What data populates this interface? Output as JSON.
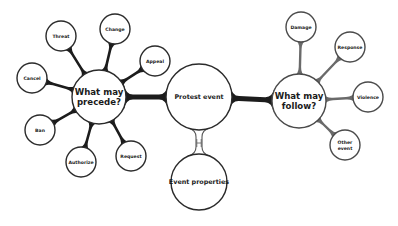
{
  "diagram": {
    "colors": {
      "background": "#ffffff",
      "stroke_dark": "#2a2a2a",
      "stroke_right": "#4a4a4a",
      "connector_left": "#1c1c1c",
      "connector_right": "#6a6a6a",
      "connector_main": "#1c1c1c",
      "connector_properties": "#555555"
    },
    "center": {
      "id": "protest",
      "label": "Protest event",
      "cx": 199,
      "cy": 97,
      "r": 33
    },
    "properties": {
      "id": "properties",
      "label": "Event properties",
      "cx": 199,
      "cy": 182,
      "r": 28
    },
    "precede_hub": {
      "id": "precede",
      "label_line1": "What may",
      "label_line2": "precede?",
      "cx": 99,
      "cy": 97,
      "r": 27
    },
    "follow_hub": {
      "id": "follow",
      "label_line1": "What may",
      "label_line2": "follow?",
      "cx": 299,
      "cy": 101,
      "r": 27
    },
    "precede_nodes": [
      {
        "label": "Cancel",
        "cx": 32,
        "cy": 78,
        "r": 15
      },
      {
        "label": "Threat",
        "cx": 61,
        "cy": 36,
        "r": 15
      },
      {
        "label": "Change",
        "cx": 115,
        "cy": 29,
        "r": 15
      },
      {
        "label": "Appeal",
        "cx": 155,
        "cy": 61,
        "r": 15
      },
      {
        "label": "Ban",
        "cx": 40,
        "cy": 130,
        "r": 15
      },
      {
        "label": "Authorize",
        "cx": 81,
        "cy": 162,
        "r": 15
      },
      {
        "label": "Request",
        "cx": 131,
        "cy": 156,
        "r": 15
      }
    ],
    "follow_nodes": [
      {
        "label": "Damage",
        "cx": 301,
        "cy": 27,
        "r": 15
      },
      {
        "label": "Response",
        "cx": 350,
        "cy": 47,
        "r": 15
      },
      {
        "label": "Violence",
        "cx": 368,
        "cy": 97,
        "r": 15
      },
      {
        "label_line1": "Other",
        "label_line2": "event",
        "cx": 345,
        "cy": 145,
        "r": 15
      }
    ]
  }
}
